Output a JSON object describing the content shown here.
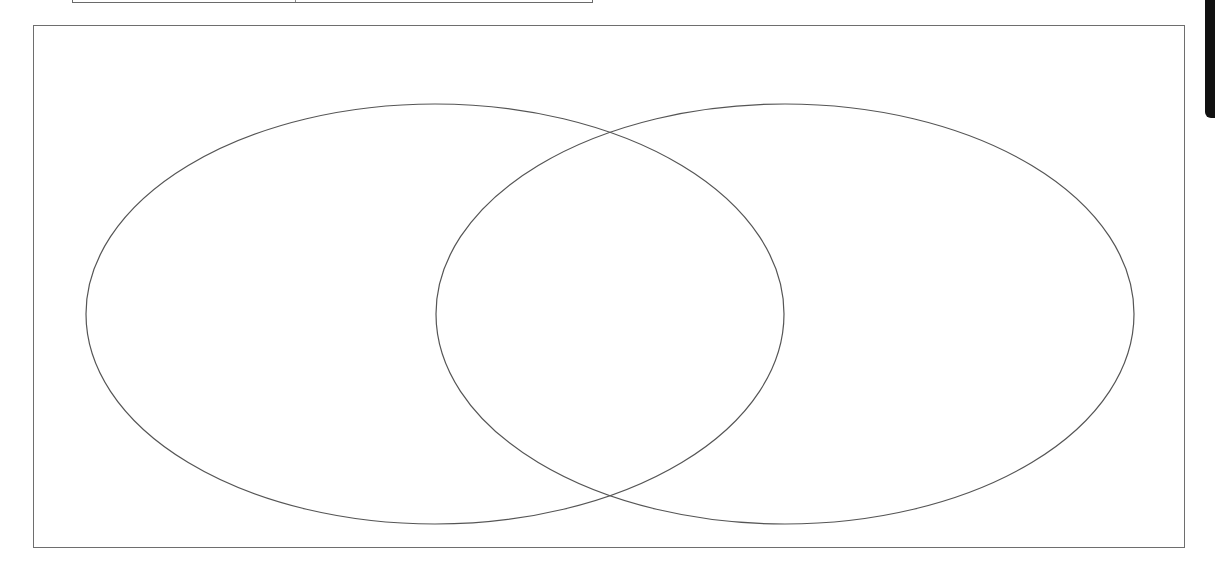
{
  "diagram": {
    "type": "venn",
    "sets": [
      {
        "name": "left-set",
        "label": "",
        "cx": 435,
        "cy": 314,
        "rx": 349,
        "ry": 210
      },
      {
        "name": "right-set",
        "label": "",
        "cx": 785,
        "cy": 314,
        "rx": 349,
        "ry": 210
      }
    ],
    "stroke_color": "#555555",
    "frame_color": "#6e6e6e",
    "labels": {
      "left": "",
      "right": "",
      "intersection": ""
    }
  },
  "header": {
    "title_left": "",
    "title_right": ""
  },
  "side_tab": {
    "color": "#111111"
  }
}
